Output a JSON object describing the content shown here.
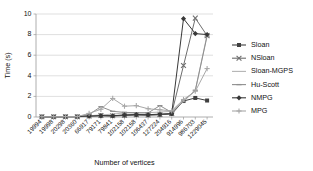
{
  "chart_data": {
    "type": "line",
    "title": "",
    "xlabel": "Number of vertices",
    "ylabel": "Time (s)",
    "ylim": [
      0,
      10
    ],
    "yticks": [
      0,
      2,
      4,
      6,
      8,
      10
    ],
    "grid": true,
    "legend_position": "right",
    "categories": [
      "19994",
      "19998",
      "20298",
      "20360",
      "66917",
      "79171",
      "79841",
      "102158",
      "102158",
      "106437",
      "127224",
      "204916",
      "914996",
      "986703",
      "1229045"
    ],
    "series": [
      {
        "name": "Sloan",
        "color": "#404040",
        "marker": "square",
        "values": [
          0.02,
          0.02,
          0.03,
          0.03,
          0.08,
          0.12,
          0.1,
          0.15,
          0.2,
          0.18,
          0.22,
          0.3,
          1.55,
          1.85,
          1.6
        ]
      },
      {
        "name": "NSloan",
        "color": "#6e6e6e",
        "marker": "cross",
        "values": [
          0.02,
          0.02,
          0.03,
          0.03,
          0.1,
          0.15,
          0.12,
          0.18,
          0.22,
          0.2,
          0.25,
          0.35,
          5.0,
          9.6,
          7.9
        ]
      },
      {
        "name": "Sloan-MGPS",
        "color": "#b4b4b4",
        "marker": "none",
        "values": [
          0.02,
          0.02,
          0.03,
          0.03,
          0.12,
          0.2,
          0.28,
          0.4,
          0.38,
          0.42,
          0.48,
          0.55,
          1.6,
          2.55,
          8.0
        ]
      },
      {
        "name": "Hu-Scott",
        "color": "#8f8f8f",
        "marker": "dash",
        "values": [
          0.03,
          0.03,
          0.04,
          0.05,
          0.25,
          1.0,
          0.55,
          0.45,
          0.42,
          0.4,
          1.1,
          0.45,
          1.5,
          2.6,
          7.85
        ]
      },
      {
        "name": "NMPG",
        "color": "#383838",
        "marker": "diamond",
        "values": [
          0.02,
          0.02,
          0.03,
          0.03,
          0.1,
          0.14,
          0.12,
          0.2,
          0.24,
          0.22,
          0.28,
          0.32,
          9.55,
          8.1,
          8.0
        ]
      },
      {
        "name": "MPG",
        "color": "#a8a8a8",
        "marker": "plus",
        "values": [
          0.03,
          0.03,
          0.04,
          0.04,
          0.35,
          0.75,
          1.8,
          1.05,
          1.1,
          0.8,
          0.7,
          0.6,
          1.7,
          2.5,
          4.7
        ]
      }
    ]
  }
}
